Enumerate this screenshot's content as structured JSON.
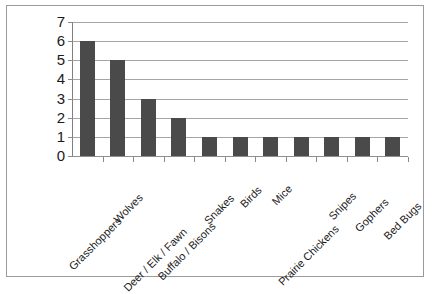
{
  "chart_data": {
    "type": "bar",
    "title": "",
    "subtitle": "",
    "xlabel": "",
    "ylabel": "",
    "ylim": [
      0,
      7
    ],
    "y_ticks": [
      0,
      1,
      2,
      3,
      4,
      5,
      6,
      7
    ],
    "grid": true,
    "legend": false,
    "orientation": "vertical",
    "bar_color": "#4a4a4a",
    "categories": [
      "Grasshoppers",
      "Wolves",
      "Deer / Elk / Fawn",
      "Buffalo / Bisons",
      "Snakes",
      "Birds",
      "Mice",
      "Prairie Chickens",
      "Snipes",
      "Gophers",
      "Bed Bugs"
    ],
    "values": [
      6,
      5,
      3,
      2,
      1,
      1,
      1,
      1,
      1,
      1,
      1
    ]
  },
  "style": {
    "frame_color": "#9a9a9a",
    "grid_color": "#a6a6a6",
    "axis_color": "#808080",
    "text_color": "#1a1a1a",
    "background": "#ffffff"
  }
}
